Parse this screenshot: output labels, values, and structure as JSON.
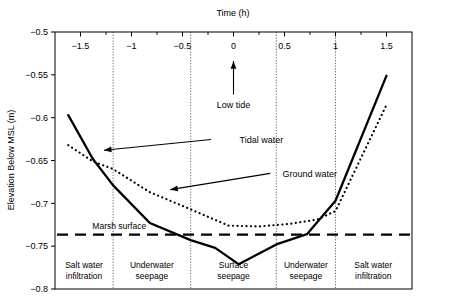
{
  "chart_data": {
    "type": "line",
    "title": "",
    "xlabel": "Time (h)",
    "ylabel": "Elevation Below MSL (m)",
    "xlim": [
      -1.75,
      1.75
    ],
    "ylim": [
      -0.8,
      -0.5
    ],
    "xticks": [
      -1.5,
      -1,
      -0.5,
      0,
      0.5,
      1,
      1.5
    ],
    "xtick_labels": [
      "−1.5",
      "−1",
      "−0.5",
      "0",
      "0.5",
      "1",
      "1.5"
    ],
    "yticks": [
      -0.5,
      -0.55,
      -0.6,
      -0.65,
      -0.7,
      -0.75,
      -0.8
    ],
    "ytick_labels": [
      "−0.5",
      "−0.55",
      "−0.6",
      "−0.65",
      "−0.7",
      "−0.75",
      "−0.8"
    ],
    "xaxis_position": "top",
    "grid": false,
    "legend": "none",
    "series": [
      {
        "name": "Tidal water",
        "style": "solid",
        "color": "#000000",
        "x": [
          -1.62,
          -1.38,
          -1.18,
          -0.82,
          -0.42,
          -0.18,
          0.05,
          0.42,
          0.72,
          1.0,
          1.5
        ],
        "y": [
          -0.597,
          -0.648,
          -0.679,
          -0.723,
          -0.743,
          -0.752,
          -0.771,
          -0.748,
          -0.736,
          -0.697,
          -0.551
        ]
      },
      {
        "name": "Ground water",
        "style": "dotted",
        "color": "#000000",
        "x": [
          -1.62,
          -1.38,
          -1.18,
          -0.82,
          -0.42,
          -0.05,
          0.25,
          0.55,
          0.82,
          1.0,
          1.5
        ],
        "y": [
          -0.632,
          -0.651,
          -0.66,
          -0.687,
          -0.707,
          -0.726,
          -0.727,
          -0.724,
          -0.719,
          -0.709,
          -0.585
        ]
      }
    ],
    "reference_lines": [
      {
        "name": "Marsh surface",
        "label": "Marsh surface",
        "style": "dashed",
        "orientation": "horizontal",
        "value": -0.7365
      }
    ],
    "dividers": {
      "style": "dotted",
      "orientation": "vertical",
      "values": [
        -1.18,
        -0.42,
        0.42,
        1.0
      ]
    },
    "zones": [
      {
        "label_line1": "Salt water",
        "label_line2": "infiltration",
        "center": -1.465
      },
      {
        "label_line1": "Underwater",
        "label_line2": "seepage",
        "center": -0.8
      },
      {
        "label_line1": "Surface",
        "label_line2": "seepage",
        "center": 0.0
      },
      {
        "label_line1": "Underwater",
        "label_line2": "seepage",
        "center": 0.71
      },
      {
        "label_line1": "Salt water",
        "label_line2": "infiltration",
        "center": 1.37
      }
    ],
    "annotations": [
      {
        "name": "tidal-water",
        "text": "Tidal water",
        "text_x": 0.06,
        "text_y": -0.6255,
        "arrow_from_x": -0.22,
        "arrow_from_y": -0.6255,
        "arrow_to_x": -1.27,
        "arrow_to_y": -0.638
      },
      {
        "name": "ground-water",
        "text": "Ground water",
        "text_x": 0.48,
        "text_y": -0.665,
        "arrow_from_x": 0.36,
        "arrow_from_y": -0.665,
        "arrow_to_x": -0.62,
        "arrow_to_y": -0.684
      },
      {
        "name": "low-tide",
        "text": "Low tide",
        "text_x": 0.0,
        "text_y": -0.585,
        "arrow_from_x": 0.0,
        "arrow_from_y": -0.573,
        "arrow_to_x": 0.0,
        "arrow_to_y": -0.534
      }
    ]
  }
}
